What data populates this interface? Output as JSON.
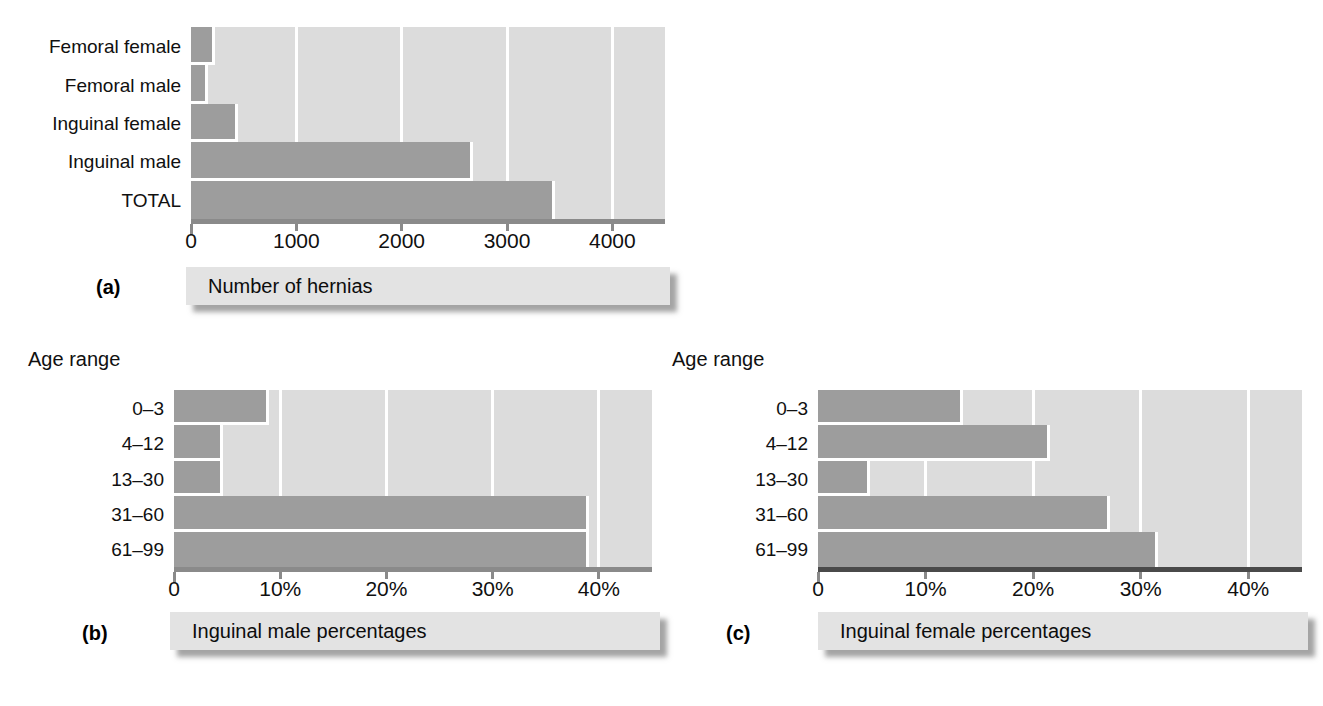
{
  "figure": {
    "panels": [
      {
        "letter": "(a)",
        "caption": "Number of hernias",
        "axis_title": "",
        "categories": [
          "Femoral female",
          "Femoral male",
          "Inguinal female",
          "Inguinal male",
          "TOTAL"
        ],
        "values": [
          200,
          130,
          420,
          2650,
          3430
        ],
        "ticks": [
          "0",
          "1000",
          "2000",
          "3000",
          "4000"
        ],
        "tick_values": [
          0,
          1000,
          2000,
          3000,
          4000
        ],
        "xmax": 4500
      },
      {
        "letter": "(b)",
        "caption": "Inguinal male percentages",
        "axis_title": "Age range",
        "categories": [
          "0–3",
          "4–12",
          "13–30",
          "31–60",
          "61–99"
        ],
        "values": [
          8.7,
          4.3,
          4.3,
          38.8,
          38.8
        ],
        "ticks": [
          "0",
          "10%",
          "20%",
          "30%",
          "40%"
        ],
        "tick_values": [
          0,
          10,
          20,
          30,
          40
        ],
        "xmax": 45
      },
      {
        "letter": "(c)",
        "caption": "Inguinal female percentages",
        "axis_title": "Age range",
        "categories": [
          "0–3",
          "4–12",
          "13–30",
          "31–60",
          "61–99"
        ],
        "values": [
          13.2,
          21.3,
          4.6,
          26.9,
          31.3
        ],
        "ticks": [
          "0",
          "10%",
          "20%",
          "30%",
          "40%"
        ],
        "tick_values": [
          0,
          10,
          20,
          30,
          40
        ],
        "xmax": 45
      }
    ]
  },
  "chart_data": [
    {
      "type": "bar",
      "orientation": "horizontal",
      "panel": "(a)",
      "title": "Number of hernias",
      "categories": [
        "Femoral female",
        "Femoral male",
        "Inguinal female",
        "Inguinal male",
        "TOTAL"
      ],
      "values": [
        200,
        130,
        420,
        2650,
        3430
      ],
      "xlabel": "Number of hernias",
      "ylabel": "",
      "xlim": [
        0,
        4500
      ],
      "xticks": [
        0,
        1000,
        2000,
        3000,
        4000
      ],
      "xticklabels": [
        "0",
        "1000",
        "2000",
        "3000",
        "4000"
      ],
      "grid": true,
      "legend": "none"
    },
    {
      "type": "bar",
      "orientation": "horizontal",
      "panel": "(b)",
      "title": "Inguinal male percentages",
      "categories": [
        "0–3",
        "4–12",
        "13–30",
        "31–60",
        "61–99"
      ],
      "values": [
        8.7,
        4.3,
        4.3,
        38.8,
        38.8
      ],
      "xlabel": "Inguinal male percentages",
      "ylabel": "Age range",
      "xlim": [
        0,
        45
      ],
      "xticks": [
        0,
        10,
        20,
        30,
        40
      ],
      "xticklabels": [
        "0",
        "10%",
        "20%",
        "30%",
        "40%"
      ],
      "grid": true,
      "legend": "none"
    },
    {
      "type": "bar",
      "orientation": "horizontal",
      "panel": "(c)",
      "title": "Inguinal female percentages",
      "categories": [
        "0–3",
        "4–12",
        "13–30",
        "31–60",
        "61–99"
      ],
      "values": [
        13.2,
        21.3,
        4.6,
        26.9,
        31.3
      ],
      "xlabel": "Inguinal female percentages",
      "ylabel": "Age range",
      "xlim": [
        0,
        45
      ],
      "xticks": [
        0,
        10,
        20,
        30,
        40
      ],
      "xticklabels": [
        "0",
        "10%",
        "20%",
        "30%",
        "40%"
      ],
      "grid": true,
      "legend": "none"
    }
  ],
  "colors": {
    "plot_background": "#dcdcdc",
    "bar_fill": "#9d9d9d",
    "gridline": "#ffffff",
    "axis": "#8a8a8a",
    "axis_dark": "#4a4a4a",
    "caption_bar": "#e3e3e3",
    "text": "#101010",
    "page_background": "#ffffff"
  }
}
